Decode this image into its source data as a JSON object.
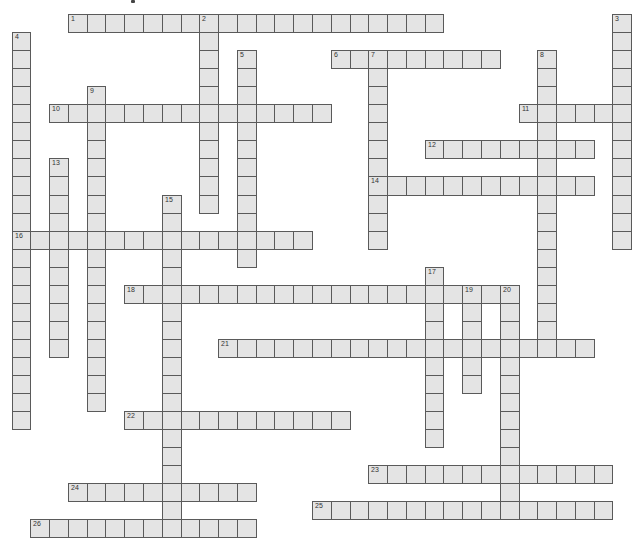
{
  "puzzle": {
    "type": "crossword",
    "grid": {
      "origin_x": 11.5,
      "origin_y": 14,
      "cell_w": 18.78,
      "cell_h": 18.05,
      "cell_fill": "#e4e4e4",
      "cell_border": "#5a5a5a"
    },
    "across": [
      {
        "number": "1",
        "row": 0,
        "col": 3,
        "length": 20
      },
      {
        "number": "6",
        "row": 2,
        "col": 17,
        "length": 9
      },
      {
        "number": "10",
        "row": 5,
        "col": 2,
        "length": 15
      },
      {
        "number": "11",
        "row": 5,
        "col": 27,
        "length": 6
      },
      {
        "number": "12",
        "row": 7,
        "col": 22,
        "length": 9
      },
      {
        "number": "14",
        "row": 9,
        "col": 19,
        "length": 12
      },
      {
        "number": "16",
        "row": 12,
        "col": 0,
        "length": 16
      },
      {
        "number": "18",
        "row": 15,
        "col": 6,
        "length": 21
      },
      {
        "number": "21",
        "row": 18,
        "col": 11,
        "length": 20
      },
      {
        "number": "22",
        "row": 22,
        "col": 6,
        "length": 12
      },
      {
        "number": "23",
        "row": 25,
        "col": 19,
        "length": 13
      },
      {
        "number": "24",
        "row": 26,
        "col": 3,
        "length": 10
      },
      {
        "number": "25",
        "row": 27,
        "col": 16,
        "length": 16
      },
      {
        "number": "26",
        "row": 28,
        "col": 1,
        "length": 12
      }
    ],
    "down": [
      {
        "number": "2",
        "row": 0,
        "col": 10,
        "length": 11
      },
      {
        "number": "3",
        "row": 0,
        "col": 32,
        "length": 13
      },
      {
        "number": "4",
        "row": 1,
        "col": 0,
        "length": 22
      },
      {
        "number": "5",
        "row": 2,
        "col": 12,
        "length": 12
      },
      {
        "number": "7",
        "row": 2,
        "col": 19,
        "length": 11
      },
      {
        "number": "8",
        "row": 2,
        "col": 28,
        "length": 16
      },
      {
        "number": "9",
        "row": 4,
        "col": 4,
        "length": 18
      },
      {
        "number": "13",
        "row": 8,
        "col": 2,
        "length": 11
      },
      {
        "number": "15",
        "row": 10,
        "col": 8,
        "length": 19
      },
      {
        "number": "17",
        "row": 14,
        "col": 22,
        "length": 10
      },
      {
        "number": "19",
        "row": 15,
        "col": 24,
        "length": 6
      },
      {
        "number": "20",
        "row": 15,
        "col": 26,
        "length": 13
      }
    ]
  }
}
